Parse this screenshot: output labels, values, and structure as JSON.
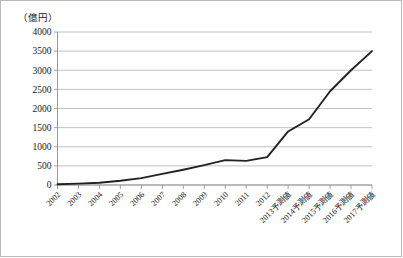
{
  "chart_data": {
    "type": "line",
    "title": "",
    "subtitle": "",
    "xlabel": "",
    "ylabel": "（億円）",
    "ylim": [
      0,
      4000
    ],
    "ytick_step": 500,
    "yticks": [
      "0",
      "500",
      "1000",
      "1500",
      "2000",
      "2500",
      "3000",
      "3500",
      "4000"
    ],
    "grid": true,
    "legend": false,
    "legend_position": "none",
    "line_color": "#222222",
    "grid_color": "#b3b3b3",
    "categories": [
      "2002",
      "2003",
      "2004",
      "2005",
      "2006",
      "2007",
      "2008",
      "2009",
      "2010",
      "2011",
      "2012",
      "2013予測値",
      "2014予測値",
      "2015予測値",
      "2016予測値",
      "2017予測値"
    ],
    "series": [
      {
        "name": "市場規模",
        "values": [
          20,
          35,
          60,
          110,
          180,
          290,
          400,
          520,
          650,
          630,
          730,
          1400,
          1720,
          2450,
          3000,
          3500
        ]
      }
    ]
  },
  "axis": {
    "unit_note": "（億円）"
  }
}
